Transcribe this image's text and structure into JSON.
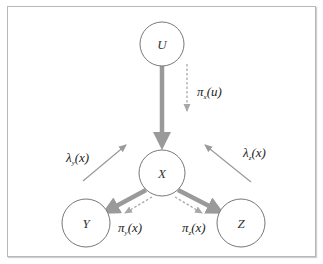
{
  "diagram": {
    "type": "bayesian-network-message-passing",
    "colors": {
      "border": "#b8b8b8",
      "node_stroke": "#777777",
      "solid_edge": "#9a9a9a",
      "lambda_edge": "#9a9a9a",
      "pi_edge": "#a8a8a8"
    },
    "nodes": [
      {
        "id": "U",
        "label": "U",
        "cx": 162,
        "cy": 44,
        "r": 22
      },
      {
        "id": "X",
        "label": "X",
        "cx": 162,
        "cy": 173,
        "r": 23
      },
      {
        "id": "Y",
        "label": "Y",
        "cx": 86,
        "cy": 223,
        "r": 24
      },
      {
        "id": "Z",
        "label": "Z",
        "cx": 241,
        "cy": 223,
        "r": 24
      }
    ],
    "edges": [
      {
        "from": "U",
        "to": "X",
        "style": "thick-solid"
      },
      {
        "from": "X",
        "to": "Y",
        "style": "thick-solid"
      },
      {
        "from": "X",
        "to": "Z",
        "style": "thick-solid"
      }
    ],
    "messages": [
      {
        "id": "pi_x_u",
        "symbol": "π",
        "sub": "x",
        "arg": "(u)",
        "style": "dashed",
        "direction": "U→X"
      },
      {
        "id": "lambda_y_x",
        "symbol": "λ",
        "sub": "y",
        "arg": "(x)",
        "style": "thin-solid",
        "direction": "Y→X"
      },
      {
        "id": "lambda_z_x",
        "symbol": "λ",
        "sub": "z",
        "arg": "(x)",
        "style": "thin-solid",
        "direction": "Z→X"
      },
      {
        "id": "pi_y_x",
        "symbol": "π",
        "sub": "y",
        "arg": "(x)",
        "style": "dashed",
        "direction": "X→Y"
      },
      {
        "id": "pi_z_x",
        "symbol": "π",
        "sub": "z",
        "arg": "(x)",
        "style": "dashed",
        "direction": "X→Z"
      }
    ]
  }
}
